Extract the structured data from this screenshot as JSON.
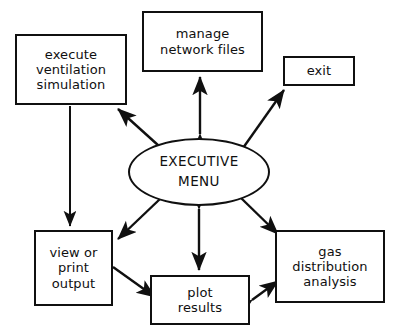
{
  "diagram": {
    "line_color": "#101010",
    "background_color": "#ffffff",
    "nodes": [
      {
        "id": "execute",
        "shape": "rectangle",
        "label": "execute\nventilation\nsimulation"
      },
      {
        "id": "manage",
        "shape": "rectangle",
        "label": "manage\nnetwork files"
      },
      {
        "id": "exit",
        "shape": "rectangle",
        "label": "exit"
      },
      {
        "id": "menu",
        "shape": "ellipse",
        "label": "EXECUTIVE\nMENU"
      },
      {
        "id": "view",
        "shape": "rectangle",
        "label": "view or\nprint\noutput"
      },
      {
        "id": "plot",
        "shape": "rectangle",
        "label": "plot\nresults"
      },
      {
        "id": "gas",
        "shape": "rectangle",
        "label": "gas\ndistribution\nanalysis"
      }
    ],
    "edges": [
      {
        "id": "menu-to-execute",
        "from": "menu",
        "to": "execute",
        "direction": "one-way"
      },
      {
        "id": "menu-manage",
        "from": "menu",
        "to": "manage",
        "direction": "two-way"
      },
      {
        "id": "menu-to-exit",
        "from": "menu",
        "to": "exit",
        "direction": "one-way"
      },
      {
        "id": "menu-view",
        "from": "menu",
        "to": "view",
        "direction": "two-way"
      },
      {
        "id": "menu-plot",
        "from": "menu",
        "to": "plot",
        "direction": "two-way"
      },
      {
        "id": "menu-gas",
        "from": "menu",
        "to": "gas",
        "direction": "two-way"
      },
      {
        "id": "execute-to-view",
        "from": "execute",
        "to": "view",
        "direction": "one-way"
      },
      {
        "id": "view-to-plot",
        "from": "view",
        "to": "plot",
        "direction": "one-way"
      },
      {
        "id": "plot-gas",
        "from": "plot",
        "to": "gas",
        "direction": "two-way"
      }
    ]
  }
}
